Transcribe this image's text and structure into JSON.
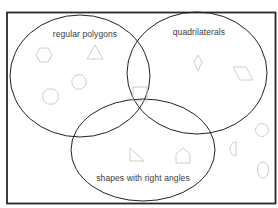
{
  "diagram": {
    "type": "venn",
    "colors": {
      "frame": "#2a2a2a",
      "circle_stroke": "#222222",
      "shape_stroke": "#c8c8c8",
      "label_text": "#3a3a3a",
      "background": "#ffffff"
    },
    "sets": [
      {
        "id": "regular-polygons",
        "label": "regular polygons"
      },
      {
        "id": "quadrilaterals",
        "label": "quadrilaterals"
      },
      {
        "id": "right-angles",
        "label": "shapes with right angles"
      }
    ],
    "shapes": [
      {
        "name": "hexagon",
        "region": "regular polygons only"
      },
      {
        "name": "equilateral triangle",
        "region": "regular polygons only"
      },
      {
        "name": "octagon (small)",
        "region": "regular polygons only"
      },
      {
        "name": "octagon",
        "region": "regular polygons only"
      },
      {
        "name": "square",
        "region": "all three sets"
      },
      {
        "name": "kite",
        "region": "quadrilaterals only"
      },
      {
        "name": "parallelogram",
        "region": "quadrilaterals only"
      },
      {
        "name": "right triangle",
        "region": "shapes with right angles only"
      },
      {
        "name": "house pentagon",
        "region": "shapes with right angles only"
      },
      {
        "name": "semicircle",
        "region": "outside all sets"
      },
      {
        "name": "circle",
        "region": "outside all sets"
      },
      {
        "name": "oval",
        "region": "outside all sets"
      }
    ]
  }
}
